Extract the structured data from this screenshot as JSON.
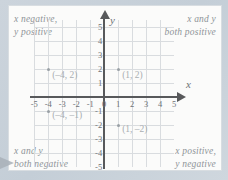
{
  "chart_data": {
    "type": "scatter",
    "title": "",
    "xlabel": "x",
    "ylabel": "y",
    "xlim": [
      -5,
      5
    ],
    "ylim": [
      -5,
      5
    ],
    "grid": true,
    "x_ticks": [
      "-5",
      "-4",
      "-3",
      "-2",
      "-1",
      "0",
      "1",
      "2",
      "3",
      "4",
      "5"
    ],
    "y_ticks_positive": [
      "5",
      "4",
      "3",
      "2",
      "1"
    ],
    "y_ticks_negative": [
      "-1",
      "-2",
      "-3",
      "-4",
      "-5"
    ],
    "points": [
      {
        "x": -4,
        "y": 2,
        "label": "(–4, 2)",
        "name": "point-neg4-2"
      },
      {
        "x": 1,
        "y": 2,
        "label": "(1, 2)",
        "name": "point-1-2"
      },
      {
        "x": -4,
        "y": -1,
        "label": "(–4, –1)",
        "name": "point-neg4-neg1"
      },
      {
        "x": 1,
        "y": -2,
        "label": "(1, –2)",
        "name": "point-1-neg2"
      }
    ],
    "annotations": [
      {
        "quadrant": "II",
        "line1": "x negative,",
        "line2": "y positive"
      },
      {
        "quadrant": "I",
        "line1": "x and y",
        "line2": "both positive"
      },
      {
        "quadrant": "III",
        "line1": "x and y",
        "line2": "both negative"
      },
      {
        "quadrant": "IV",
        "line1": "x positive,",
        "line2": "y negative"
      }
    ]
  },
  "quadrants": {
    "upper_left": {
      "line1": "x negative,",
      "line2": "y positive"
    },
    "upper_right": {
      "line1": "x and y",
      "line2": "both positive"
    },
    "lower_left": {
      "line1": "x and y",
      "line2": "both negative"
    },
    "lower_right": {
      "line1": "x positive,",
      "line2": "y negative"
    }
  },
  "axes": {
    "x_label": "x",
    "y_label": "y"
  },
  "colors": {
    "grid": "#d9dcdf",
    "axis": "#58595b",
    "text": "#8e9398",
    "point": "#9aa0a5",
    "card": "#fbfbfa",
    "background": "#c9d2da"
  }
}
